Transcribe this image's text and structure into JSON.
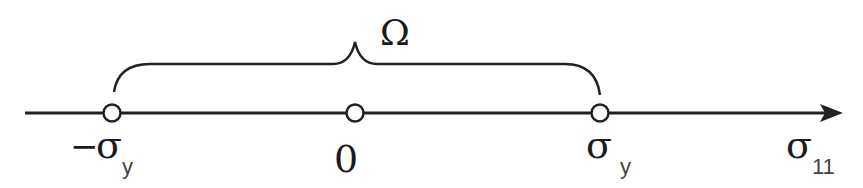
{
  "diagram": {
    "type": "number-line",
    "axis_label": {
      "symbol": "σ",
      "subscript": "11"
    },
    "region_label": "Ω",
    "points": [
      {
        "id": "neg-yield",
        "prefix": "−",
        "symbol": "σ",
        "subscript": "y",
        "x": 112
      },
      {
        "id": "zero",
        "prefix": "",
        "symbol": "0",
        "subscript": "",
        "x": 355
      },
      {
        "id": "pos-yield",
        "prefix": "",
        "symbol": "σ",
        "subscript": "y",
        "x": 600
      }
    ],
    "brace": {
      "from": "neg-yield",
      "to": "pos-yield",
      "label": "Ω"
    },
    "colors": {
      "stroke": "#222222",
      "point_fill": "#ffffff",
      "background": "#ffffff"
    }
  }
}
